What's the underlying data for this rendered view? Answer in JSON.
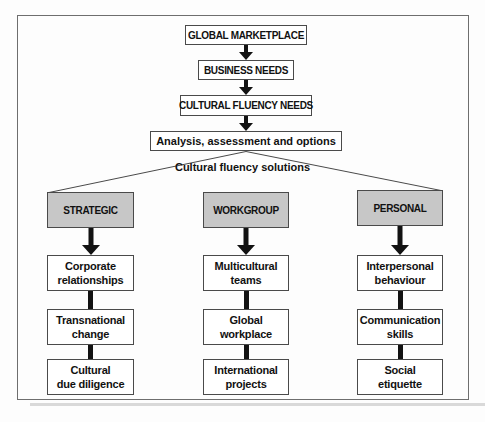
{
  "flow": {
    "boxes": [
      "GLOBAL MARKETPLACE",
      "BUSINESS NEEDS",
      "CULTURAL FLUENCY NEEDS",
      "Analysis, assessment and options"
    ]
  },
  "solutions_label": "Cultural fluency solutions",
  "columns": [
    {
      "header": "STRATEGIC",
      "items": [
        "Corporate\nrelationships",
        "Transnational\nchange",
        "Cultural\ndue diligence"
      ]
    },
    {
      "header": "WORKGROUP",
      "items": [
        "Multicultural\nteams",
        "Global\nworkplace",
        "International\nprojects"
      ]
    },
    {
      "header": "PERSONAL",
      "items": [
        "Interpersonal\nbehaviour",
        "Communication\nskills",
        "Social\netiquette"
      ]
    }
  ],
  "colors": {
    "category_fill": "#c7c7c7",
    "box_border": "#4a4a4a",
    "arrow": "#121212"
  }
}
